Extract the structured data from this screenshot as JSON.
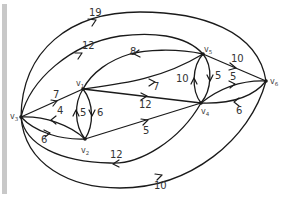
{
  "diagram": {
    "type": "directed-weighted-graph",
    "nodes": [
      {
        "id": "v1",
        "label": "v",
        "sub": "1",
        "x": 83,
        "y": 89
      },
      {
        "id": "v2",
        "label": "v",
        "sub": "2",
        "x": 85,
        "y": 139
      },
      {
        "id": "v3",
        "label": "v",
        "sub": "3",
        "x": 21,
        "y": 117
      },
      {
        "id": "v4",
        "label": "v",
        "sub": "4",
        "x": 201,
        "y": 103
      },
      {
        "id": "v5",
        "label": "v",
        "sub": "5",
        "x": 203,
        "y": 54
      },
      {
        "id": "v6",
        "label": "v",
        "sub": "6",
        "x": 266,
        "y": 81
      }
    ],
    "edges": [
      {
        "from": "v6",
        "to": "v3",
        "weight": "19"
      },
      {
        "from": "v5",
        "to": "v3",
        "weight": "12"
      },
      {
        "from": "v5",
        "to": "v1",
        "weight": "8"
      },
      {
        "from": "v3",
        "to": "v1",
        "weight": "7"
      },
      {
        "from": "v2",
        "to": "v3",
        "weight": "4"
      },
      {
        "from": "v3",
        "to": "v2",
        "weight": "6"
      },
      {
        "from": "v2",
        "to": "v1",
        "weight": "5"
      },
      {
        "from": "v1",
        "to": "v2",
        "weight": "6"
      },
      {
        "from": "v1",
        "to": "v5",
        "weight": "7"
      },
      {
        "from": "v1",
        "to": "v4",
        "weight": "12"
      },
      {
        "from": "v2",
        "to": "v4",
        "weight": "5"
      },
      {
        "from": "v4",
        "to": "v5",
        "weight": "10"
      },
      {
        "from": "v5",
        "to": "v4",
        "weight": "5"
      },
      {
        "from": "v5",
        "to": "v6",
        "weight": "10"
      },
      {
        "from": "v4",
        "to": "v6",
        "weight": "5"
      },
      {
        "from": "v6",
        "to": "v4",
        "weight": "6"
      },
      {
        "from": "v4",
        "to": "v3",
        "weight": "12"
      },
      {
        "from": "v3",
        "to": "v6",
        "weight": "10"
      }
    ]
  },
  "labels": {
    "v": "v",
    "s1": "1",
    "s2": "2",
    "s3": "3",
    "s4": "4",
    "s5": "5",
    "s6": "6",
    "w19": "19",
    "w12top": "12",
    "w8": "8",
    "w7left": "7",
    "w4": "4",
    "w6left": "6",
    "w5v": "5",
    "w6v": "6",
    "w7mid": "7",
    "w12mid": "12",
    "w5mid": "5",
    "w10v": "10",
    "w5v2": "5",
    "w10top": "10",
    "w5right": "5",
    "w6right": "6",
    "w12bot": "12",
    "w10bot": "10"
  }
}
